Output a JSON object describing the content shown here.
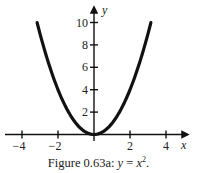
{
  "chart_data": {
    "type": "line",
    "function": "y = x^2",
    "xlabel": "x",
    "ylabel": "y",
    "xlim": [
      -5,
      5
    ],
    "ylim": [
      0,
      11
    ],
    "x_ticks": [
      -4,
      -2,
      0,
      2,
      4
    ],
    "x_tick_labels": [
      "−4",
      "−2",
      "2",
      "4"
    ],
    "y_ticks": [
      2,
      4,
      6,
      8,
      10
    ],
    "y_tick_labels": [
      "2",
      "4",
      "6",
      "8",
      "10"
    ],
    "grid": false,
    "legend": null,
    "series": [
      {
        "name": "y = x^2",
        "x": [
          -3.16,
          -3,
          -2.5,
          -2,
          -1.5,
          -1,
          -0.5,
          0,
          0.5,
          1,
          1.5,
          2,
          2.5,
          3,
          3.16
        ],
        "values": [
          10,
          9,
          6.25,
          4,
          2.25,
          1,
          0.25,
          0,
          0.25,
          1,
          2.25,
          4,
          6.25,
          9,
          10
        ]
      }
    ]
  },
  "caption": {
    "prefix": "Figure 0.63a: ",
    "math_y": "y",
    "equals": " = ",
    "math_x": "x",
    "exponent": "2",
    "suffix": "."
  },
  "axes": {
    "x_label": "x",
    "y_label": "y"
  }
}
